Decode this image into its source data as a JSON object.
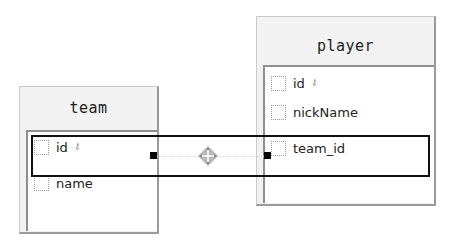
{
  "diagram": {
    "tables": [
      {
        "name": "team",
        "columns": [
          {
            "name": "id",
            "primary_key": true,
            "icon": "key-icon"
          },
          {
            "name": "name",
            "primary_key": false
          }
        ]
      },
      {
        "name": "player",
        "columns": [
          {
            "name": "id",
            "primary_key": true,
            "icon": "key-icon"
          },
          {
            "name": "nickName",
            "primary_key": false
          },
          {
            "name": "team_id",
            "primary_key": false
          }
        ]
      }
    ],
    "relationship": {
      "from": "team.id",
      "to": "player.team_id",
      "icon": "move-icon"
    },
    "key_glyph": "•⌥"
  },
  "colors": {
    "line": "#111111",
    "frame": "#9a9a9a",
    "header_bg": "#f2f2f2"
  }
}
